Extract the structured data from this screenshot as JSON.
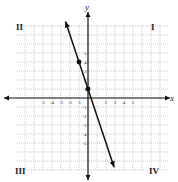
{
  "chart_data": {
    "type": "line",
    "title": "",
    "xlabel": "x",
    "ylabel": "y",
    "xlim": [
      -8,
      8
    ],
    "ylim": [
      -8,
      8
    ],
    "grid": true,
    "x_tick_labels": [
      "-5",
      "-4",
      "-3",
      "-2",
      "-1",
      "2",
      "3",
      "4",
      "5"
    ],
    "y_tick_labels": [
      "5",
      "4",
      "3",
      "2",
      "1",
      "-1",
      "-2",
      "-3",
      "-4",
      "-5"
    ],
    "quadrant_labels": {
      "I": "I",
      "II": "II",
      "III": "III",
      "IV": "IV"
    },
    "series": [
      {
        "name": "line",
        "equation": "y = -3x + 1",
        "x": [
          -2.5,
          2.9
        ],
        "y": [
          8.5,
          -7.7
        ],
        "arrows": "both",
        "marked_points": [
          {
            "x": -1,
            "y": 4
          },
          {
            "x": 0,
            "y": 1
          }
        ]
      }
    ]
  },
  "axes": {
    "x_label": "x",
    "y_label": "y"
  },
  "quadrants": {
    "q1": "I",
    "q2": "II",
    "q3": "III",
    "q4": "IV"
  }
}
